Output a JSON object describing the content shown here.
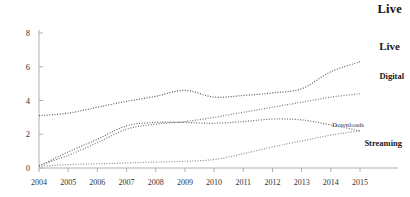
{
  "figure": {
    "corner_title": "Live"
  },
  "chart_data": {
    "type": "line",
    "title": "Live",
    "xlabel": "",
    "ylabel": "",
    "x": [
      2004,
      2005,
      2006,
      2007,
      2008,
      2009,
      2010,
      2011,
      2012,
      2013,
      2014,
      2015
    ],
    "categories": [
      "2004",
      "2005",
      "2006",
      "2007",
      "2008",
      "2009",
      "2010",
      "2011",
      "2012",
      "2013",
      "2014",
      "2015"
    ],
    "xlim": [
      2004,
      2015
    ],
    "ylim": [
      0,
      8
    ],
    "yticks": [
      0,
      2,
      4,
      6,
      8
    ],
    "ytick_labels": [
      "0",
      "2",
      "4",
      "6",
      "8"
    ],
    "xtick_labels": [
      "2004",
      "2005",
      "2006",
      "2007",
      "2008",
      "2009",
      "2010",
      "2011",
      "2012",
      "2013",
      "2014",
      "2015"
    ],
    "grid": false,
    "legend": "inline-end-labels",
    "line_style": "dotted",
    "series": [
      {
        "name": "Live",
        "label": "Live",
        "color": "#555555",
        "values": [
          3.1,
          3.25,
          3.6,
          3.95,
          4.25,
          4.6,
          4.2,
          4.3,
          4.45,
          4.7,
          5.7,
          6.3
        ]
      },
      {
        "name": "Digital",
        "label": "Digital",
        "color": "#777777",
        "values": [
          0.15,
          0.75,
          1.5,
          2.3,
          2.6,
          2.75,
          3.0,
          3.3,
          3.6,
          3.9,
          4.2,
          4.4
        ]
      },
      {
        "name": "Downloads",
        "label": "Downloads",
        "color": "#666666",
        "values": [
          0.1,
          0.95,
          1.7,
          2.5,
          2.7,
          2.7,
          2.65,
          2.75,
          2.9,
          2.85,
          2.55,
          2.2
        ]
      },
      {
        "name": "Streaming",
        "label": "Streaming",
        "color": "#8a8a8a",
        "values": [
          0.1,
          0.2,
          0.25,
          0.3,
          0.35,
          0.4,
          0.5,
          0.85,
          1.25,
          1.6,
          1.95,
          2.2
        ]
      }
    ]
  },
  "axes": {
    "axis_color": "#aaaaaa",
    "tick_color": "#333333"
  }
}
